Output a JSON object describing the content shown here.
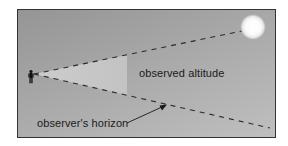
{
  "diagram": {
    "type": "observed altitude illustration",
    "labels": {
      "altitude": "observed altitude",
      "horizon": "observer's horizon"
    },
    "elements": {
      "observer": "observer-figure",
      "celestial_body": "sun",
      "line_of_sight": "dashed line from observer to sun",
      "horizon_line": "dashed line from observer along horizon",
      "angle_wedge": "shaded wedge between horizon and line of sight",
      "arrow": "arrow pointing from horizon label to horizon line"
    },
    "colors": {
      "background_top": "#959595",
      "background_bottom": "#bfbfbf",
      "wedge": "#c8c8c8",
      "dash": "#2a2a2a",
      "sun": "#ffffff",
      "border": "#333333",
      "text": "#1a1a1a"
    }
  }
}
